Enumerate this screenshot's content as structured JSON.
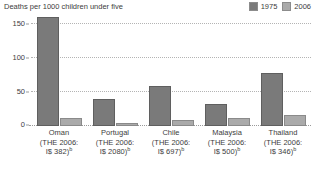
{
  "chart_data": {
    "type": "bar",
    "title": "Deaths per 1000 children under five",
    "xlabel": "",
    "ylabel": "",
    "ylim": [
      0,
      160
    ],
    "yticks": [
      0,
      50,
      100,
      150
    ],
    "ytick_labels": [
      "0",
      "50",
      "100",
      "150"
    ],
    "grid": true,
    "legend_position": "top-right",
    "categories": [
      "Oman",
      "Portugal",
      "Chile",
      "Malaysia",
      "Thailand"
    ],
    "series": [
      {
        "name": "1975",
        "color": "#7a7a7a",
        "values": [
          190,
          40,
          58,
          33,
          78
        ]
      },
      {
        "name": "2006",
        "color": "#aaaaaa",
        "values": [
          12,
          5,
          9,
          12,
          16
        ]
      }
    ],
    "annotations": [
      "Oman 1975 bar is clipped at the top of the plot area"
    ]
  },
  "header": {
    "title": "Deaths per 1000 children under five"
  },
  "legend": {
    "items": [
      {
        "label": "1975",
        "color": "#7a7a7a"
      },
      {
        "label": "2006",
        "color": "#aaaaaa"
      }
    ]
  },
  "axis": {
    "y_labels": [
      "150",
      "100",
      "50",
      "0"
    ]
  },
  "categories": [
    {
      "name": "Oman",
      "the": "(THE 2006:",
      "amount": "I$ 382)",
      "note": "b"
    },
    {
      "name": "Portugal",
      "the": "(THE 2006:",
      "amount": "I$ 2080)",
      "note": "b"
    },
    {
      "name": "Chile",
      "the": "(THE 2006:",
      "amount": "I$ 697)",
      "note": "b"
    },
    {
      "name": "Malaysia",
      "the": "(THE 2006:",
      "amount": "I$ 500)",
      "note": "b"
    },
    {
      "name": "Thailand",
      "the": "(THE 2006:",
      "amount": "I$ 346)",
      "note": "b"
    }
  ]
}
